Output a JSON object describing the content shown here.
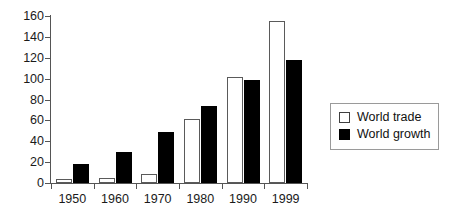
{
  "chart_data": {
    "type": "bar",
    "title": "",
    "subtitle": "",
    "xlabel": "",
    "ylabel": "",
    "categories": [
      "1950",
      "1960",
      "1970",
      "1980",
      "1990",
      "1999"
    ],
    "series": [
      {
        "name": "World trade",
        "color": "#ffffff",
        "values": [
          4,
          5,
          9,
          61,
          102,
          155
        ]
      },
      {
        "name": "World growth",
        "color": "#000000",
        "values": [
          18,
          30,
          49,
          74,
          99,
          118
        ]
      }
    ],
    "ylim": [
      0,
      160
    ],
    "ytick_values": [
      0,
      20,
      40,
      60,
      80,
      100,
      120,
      140,
      160
    ],
    "ytick_labels": [
      "0",
      "20",
      "40",
      "60",
      "80",
      "100",
      "120",
      "140",
      "160"
    ],
    "grid": false,
    "legend_position": "right",
    "legend_entries": [
      "World trade",
      "World growth"
    ]
  },
  "legend": {
    "items": [
      {
        "label": "World trade"
      },
      {
        "label": "World growth"
      }
    ]
  },
  "axes": {
    "y_axis_name": "y-axis",
    "x_axis_name": "x-axis"
  }
}
